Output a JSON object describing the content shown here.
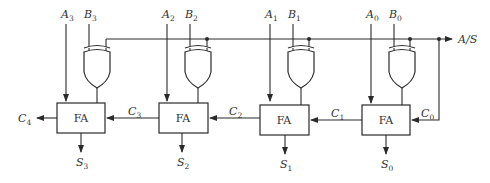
{
  "control": {
    "label": "A/S"
  },
  "stages": [
    {
      "a": "A",
      "a_sub": "3",
      "b": "B",
      "b_sub": "3",
      "block": "FA",
      "s": "S",
      "s_sub": "3",
      "cin": "C",
      "cin_sub": "3",
      "cout": "C",
      "cout_sub": "4"
    },
    {
      "a": "A",
      "a_sub": "2",
      "b": "B",
      "b_sub": "2",
      "block": "FA",
      "s": "S",
      "s_sub": "2",
      "cin": "C",
      "cin_sub": "2"
    },
    {
      "a": "A",
      "a_sub": "1",
      "b": "B",
      "b_sub": "1",
      "block": "FA",
      "s": "S",
      "s_sub": "1",
      "cin": "C",
      "cin_sub": "1"
    },
    {
      "a": "A",
      "a_sub": "0",
      "b": "B",
      "b_sub": "0",
      "block": "FA",
      "s": "S",
      "s_sub": "0",
      "cin": "C",
      "cin_sub": "0"
    }
  ],
  "colors": {
    "line": "#2a2a2a",
    "text": "#333333",
    "background": "#ffffff"
  }
}
